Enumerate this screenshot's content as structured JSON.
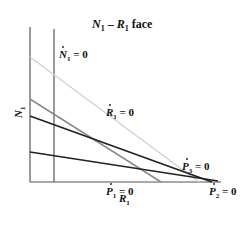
{
  "title": {
    "var1": "N",
    "sub1": "1",
    "dash": " – ",
    "var2": "R",
    "sub2": "1",
    "rest": " face"
  },
  "axes": {
    "ylabel": {
      "var": "N",
      "sub": "1"
    },
    "xlabel": {
      "var": "R",
      "sub": "1"
    }
  },
  "isoclines": [
    {
      "id": "N1dot",
      "var": "N",
      "sub": "1",
      "eq": " = 0",
      "color": "#555555"
    },
    {
      "id": "R1dot",
      "var": "R",
      "sub": "1",
      "eq": " = 0",
      "color": "#c8c8c8"
    },
    {
      "id": "P1dot",
      "var": "P",
      "sub": "1",
      "eq": " = 0",
      "color": "#8a8a8a"
    },
    {
      "id": "P2dot",
      "var": "P",
      "sub": "2",
      "eq": " = 0",
      "color": "#222222"
    },
    {
      "id": "P3dot",
      "var": "P",
      "sub": "3",
      "eq": " = 0",
      "color": "#222222"
    }
  ]
}
